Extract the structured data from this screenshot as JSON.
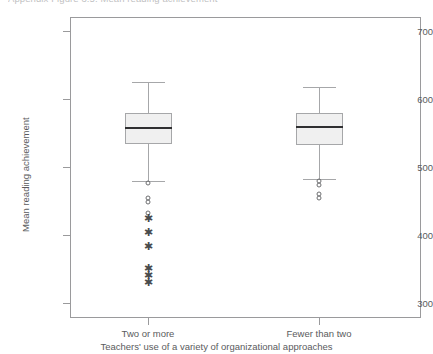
{
  "caption": {
    "clipped_top_text": "Appendix Figure 3.5: Mean reading achievement"
  },
  "chart_data": {
    "type": "box",
    "title": "",
    "xlabel": "Teachers' use of a variety of organizational approaches",
    "ylabel": "Mean reading achievement",
    "categories": [
      "Two or more",
      "Fewer than two"
    ],
    "yticks": [
      300,
      400,
      500,
      600,
      700
    ],
    "ylim": [
      285,
      722
    ],
    "grid": false,
    "legend": null,
    "colors": {
      "box_fill": "#f0f0f0",
      "box_edge": "#a6a7a9",
      "median": "#2f2f31",
      "axis": "#9a9a9c",
      "text": "#5a5b5d"
    },
    "boxes": [
      {
        "category": "Two or more",
        "whisker_high": 625,
        "q3": 579,
        "median": 557,
        "q1": 534,
        "whisker_low": 479,
        "outliers_circle": [
          476,
          455,
          449,
          432
        ],
        "outliers_star": [
          425,
          404,
          384,
          352,
          341,
          331
        ]
      },
      {
        "category": "Fewer than two",
        "whisker_high": 617,
        "q3": 579,
        "median": 559,
        "q1": 533,
        "whisker_low": 482,
        "outliers_circle": [
          479,
          473,
          460,
          455
        ],
        "outliers_star": []
      }
    ]
  }
}
